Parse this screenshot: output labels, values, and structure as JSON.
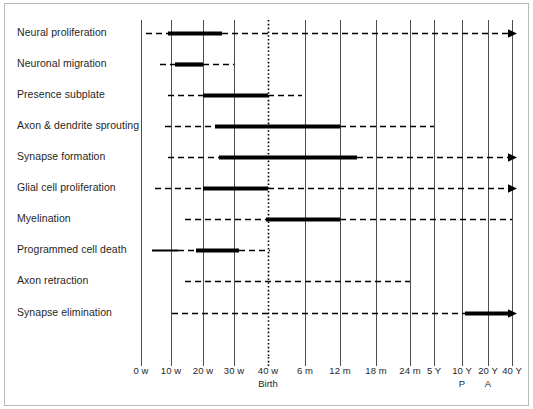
{
  "chart_data": {
    "type": "table",
    "title": "",
    "subtitle": "",
    "xlabel": "",
    "ylabel": "",
    "grid": true,
    "legend": false,
    "axis": {
      "orientation": "horizontal",
      "scale": "ordinal-developmental-time",
      "ticks": [
        {
          "label": "0 w",
          "sub": "",
          "x": 141
        },
        {
          "label": "10 w",
          "sub": "",
          "x": 171
        },
        {
          "label": "20 w",
          "sub": "",
          "x": 203
        },
        {
          "label": "30 w",
          "sub": "",
          "x": 234
        },
        {
          "label": "40 w",
          "sub": "Birth",
          "x": 268,
          "style": "dotted"
        },
        {
          "label": "6 m",
          "sub": "",
          "x": 305
        },
        {
          "label": "12 m",
          "sub": "",
          "x": 340
        },
        {
          "label": "18 m",
          "sub": "",
          "x": 376
        },
        {
          "label": "24 m",
          "sub": "",
          "x": 410
        },
        {
          "label": "5 Y",
          "sub": "",
          "x": 434
        },
        {
          "label": "10 Y",
          "sub": "P",
          "x": 462
        },
        {
          "label": "20 Y",
          "sub": "A",
          "x": 488
        },
        {
          "label": "40 Y",
          "sub": "",
          "x": 512
        }
      ]
    },
    "categories": [
      "Neural proliferation",
      "Neuronal migration",
      "Presence subplate",
      "Axon & dendrite sprouting",
      "Synapse formation",
      "Glial cell proliferation",
      "Myelination",
      "Programmed cell death",
      "Axon retraction",
      "Synapse elimination"
    ],
    "rows": [
      {
        "label": "Neural proliferation",
        "y": 33,
        "segments": [
          {
            "kind": "dashed",
            "x1": 146,
            "x2": 168
          },
          {
            "kind": "thick",
            "x1": 168,
            "x2": 222
          },
          {
            "kind": "dashed",
            "x1": 222,
            "x2": 512
          }
        ],
        "arrow": true,
        "arrow_x": 512,
        "span_text": "0 w – 40 Y (peak 10–22 w)"
      },
      {
        "label": "Neuronal migration",
        "y": 64,
        "segments": [
          {
            "kind": "dashed",
            "x1": 160,
            "x2": 175
          },
          {
            "kind": "thick",
            "x1": 175,
            "x2": 203
          },
          {
            "kind": "dashed",
            "x1": 203,
            "x2": 234
          }
        ],
        "arrow": false,
        "span_text": "8 w – 30 w (peak 12–20 w)"
      },
      {
        "label": "Presence subplate",
        "y": 95,
        "segments": [
          {
            "kind": "dashed",
            "x1": 168,
            "x2": 203
          },
          {
            "kind": "thick",
            "x1": 203,
            "x2": 268
          },
          {
            "kind": "dashed",
            "x1": 268,
            "x2": 302
          }
        ],
        "arrow": false,
        "span_text": "10 w – ~4 m (peak 20–40 w)"
      },
      {
        "label": "Axon & dendrite sprouting",
        "y": 126,
        "segments": [
          {
            "kind": "dashed",
            "x1": 165,
            "x2": 215
          },
          {
            "kind": "thick",
            "x1": 215,
            "x2": 340
          },
          {
            "kind": "dashed",
            "x1": 340,
            "x2": 434
          }
        ],
        "arrow": false,
        "span_text": "8 w – 5 Y (peak 22 w – 12 m)"
      },
      {
        "label": "Synapse formation",
        "y": 157,
        "segments": [
          {
            "kind": "dashed",
            "x1": 168,
            "x2": 219
          },
          {
            "kind": "thick",
            "x1": 219,
            "x2": 357
          },
          {
            "kind": "dashed",
            "x1": 357,
            "x2": 512
          }
        ],
        "arrow": true,
        "arrow_x": 512,
        "span_text": "10 w – 40 Y (peak 24 w – 15 m)"
      },
      {
        "label": "Glial cell proliferation",
        "y": 188,
        "segments": [
          {
            "kind": "dashed",
            "x1": 155,
            "x2": 203
          },
          {
            "kind": "thick",
            "x1": 203,
            "x2": 268
          },
          {
            "kind": "dashed",
            "x1": 268,
            "x2": 512
          }
        ],
        "arrow": true,
        "arrow_x": 512,
        "span_text": "5 w – 40 Y (peak 20–40 w)"
      },
      {
        "label": "Myelination",
        "y": 219,
        "segments": [
          {
            "kind": "dashed",
            "x1": 185,
            "x2": 266
          },
          {
            "kind": "thick",
            "x1": 266,
            "x2": 340
          },
          {
            "kind": "dashed",
            "x1": 340,
            "x2": 512
          }
        ],
        "arrow": false,
        "span_text": "16 w – 40 Y (peak birth – 12 m)"
      },
      {
        "label": "Programmed cell death",
        "y": 250,
        "segments": [
          {
            "kind": "thin",
            "x1": 152,
            "x2": 178
          },
          {
            "kind": "dashed",
            "x1": 178,
            "x2": 196
          },
          {
            "kind": "thick",
            "x1": 196,
            "x2": 239
          },
          {
            "kind": "dashed",
            "x1": 239,
            "x2": 270
          }
        ],
        "arrow": false,
        "span_text": "4 w – 40 w (peak 18–31 w)"
      },
      {
        "label": "Axon retraction",
        "y": 281,
        "segments": [
          {
            "kind": "dashed",
            "x1": 185,
            "x2": 410
          }
        ],
        "arrow": false,
        "span_text": "16 w – 24 m"
      },
      {
        "label": "Synapse elimination",
        "y": 313,
        "segments": [
          {
            "kind": "dashed",
            "x1": 172,
            "x2": 465
          },
          {
            "kind": "thick",
            "x1": 465,
            "x2": 512
          }
        ],
        "arrow": true,
        "arrow_x": 512,
        "span_text": "11 w – 40 Y (peak 10–40 Y)"
      }
    ],
    "legend_entries": [
      {
        "key": "thick",
        "meaning": "peak / maximal period"
      },
      {
        "key": "dashed",
        "meaning": "ongoing / lower-rate period"
      },
      {
        "key": "arrow",
        "meaning": "process continues beyond axis"
      }
    ],
    "colors": {
      "line": "#000000",
      "gridline": "#4d4d4d",
      "birth_gridline": "#000000",
      "frame": "#b9b9b9",
      "text": "#1f1f1f",
      "background": "#ffffff"
    },
    "geometry": {
      "plot_top": 20,
      "plot_bottom": 357,
      "axis_label_y": 366,
      "axis_sub_y": 379,
      "label_right_edge": 132,
      "tick_mark_top": 357,
      "tick_mark_bottom": 366
    }
  }
}
